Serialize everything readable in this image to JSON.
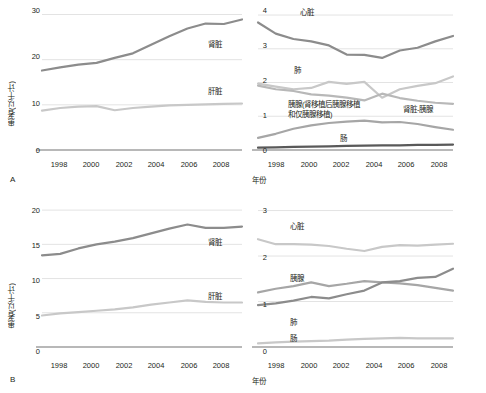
{
  "figure": {
    "background": "#ffffff",
    "colors": {
      "dark_gray": "#8c8c8c",
      "mid_gray": "#a6a6a6",
      "light_gray": "#c8c8c8",
      "very_light_gray": "#d6d6d6",
      "near_black": "#595959",
      "axis": "#a0a0a0",
      "grid": "#e3e3e3",
      "text": "#231f20"
    },
    "panel_letters": [
      "A",
      "B"
    ],
    "xaxis_title": "年份",
    "yaxis_title": "患者(以千计)"
  },
  "chart_data": [
    {
      "id": "panel-a-left",
      "type": "line",
      "title": "",
      "xlabel": "年份",
      "ylabel": "患者(以千计)",
      "panel_letter": "A",
      "x": [
        1998,
        1999,
        2000,
        2001,
        2002,
        2003,
        2004,
        2005,
        2006,
        2007,
        2008,
        2009
      ],
      "xticks": [
        1998,
        2000,
        2002,
        2004,
        2006,
        2008
      ],
      "yticks": [
        0,
        10,
        20,
        30
      ],
      "ylim": [
        0,
        31
      ],
      "grid": true,
      "legend_position": "inline-right",
      "series": [
        {
          "name": "肾脏",
          "color": "#8c8c8c",
          "values": [
            17.6,
            18.3,
            18.9,
            19.3,
            20.4,
            21.4,
            23.3,
            25.2,
            26.9,
            28.0,
            27.9,
            28.9
          ]
        },
        {
          "name": "肝脏",
          "color": "#c8c8c8",
          "values": [
            8.7,
            9.3,
            9.6,
            9.7,
            8.8,
            9.3,
            9.6,
            9.9,
            10.0,
            10.1,
            10.2,
            10.3
          ]
        }
      ]
    },
    {
      "id": "panel-a-right",
      "type": "line",
      "title": "",
      "xlabel": "年份",
      "ylabel": "",
      "panel_letter": "",
      "x": [
        1998,
        1999,
        2000,
        2001,
        2002,
        2003,
        2004,
        2005,
        2006,
        2007,
        2008,
        2009
      ],
      "xticks": [
        1998,
        2000,
        2002,
        2004,
        2006,
        2008
      ],
      "yticks": [
        0,
        1,
        2,
        3,
        4
      ],
      "ylim": [
        0,
        4.15
      ],
      "grid": true,
      "legend_position": "inline",
      "series": [
        {
          "name": "心脏",
          "color": "#8c8c8c",
          "values": [
            3.78,
            3.45,
            3.29,
            3.22,
            3.1,
            2.83,
            2.82,
            2.73,
            2.95,
            3.03,
            3.22,
            3.38
          ]
        },
        {
          "name": "肺",
          "color": "#c8c8c8",
          "values": [
            1.97,
            1.88,
            1.8,
            1.84,
            2.02,
            1.96,
            2.02,
            1.55,
            1.8,
            1.9,
            1.98,
            2.18
          ]
        },
        {
          "name": "肾脏-胰腺",
          "color": "#b8b8b8",
          "values": [
            1.91,
            1.8,
            1.75,
            1.65,
            1.61,
            1.55,
            1.47,
            1.67,
            1.54,
            1.46,
            1.4,
            1.37
          ]
        },
        {
          "name": "胰腺(肾移植后胰腺移植和仅胰腺移植)",
          "color": "#a6a6a6",
          "values": [
            0.36,
            0.48,
            0.63,
            0.73,
            0.8,
            0.84,
            0.87,
            0.82,
            0.83,
            0.77,
            0.68,
            0.6
          ]
        },
        {
          "name": "肠",
          "color": "#595959",
          "values": [
            0.07,
            0.08,
            0.09,
            0.1,
            0.11,
            0.12,
            0.13,
            0.14,
            0.14,
            0.15,
            0.15,
            0.16
          ]
        }
      ]
    },
    {
      "id": "panel-b-left",
      "type": "line",
      "title": "",
      "xlabel": "年份",
      "ylabel": "患者(以千计)",
      "panel_letter": "B",
      "x": [
        1998,
        1999,
        2000,
        2001,
        2002,
        2003,
        2004,
        2005,
        2006,
        2007,
        2008,
        2009
      ],
      "xticks": [
        1998,
        2000,
        2002,
        2004,
        2006,
        2008
      ],
      "yticks": [
        0,
        5,
        10,
        15,
        20
      ],
      "ylim": [
        0,
        20.6
      ],
      "grid": true,
      "legend_position": "inline-right",
      "series": [
        {
          "name": "肾脏",
          "color": "#8c8c8c",
          "values": [
            13.4,
            13.6,
            14.4,
            15.0,
            15.4,
            15.9,
            16.6,
            17.3,
            17.9,
            17.4,
            17.4,
            17.6
          ]
        },
        {
          "name": "肝脏",
          "color": "#c8c8c8",
          "values": [
            4.6,
            4.9,
            5.1,
            5.3,
            5.5,
            5.8,
            6.2,
            6.5,
            6.8,
            6.6,
            6.5,
            6.5
          ]
        }
      ]
    },
    {
      "id": "panel-b-right",
      "type": "line",
      "title": "",
      "xlabel": "年份",
      "ylabel": "",
      "panel_letter": "",
      "x": [
        1998,
        1999,
        2000,
        2001,
        2002,
        2003,
        2004,
        2005,
        2006,
        2007,
        2008,
        2009
      ],
      "xticks": [
        1998,
        2000,
        2002,
        2004,
        2006,
        2008
      ],
      "yticks": [
        0,
        1,
        2,
        3
      ],
      "ylim": [
        0,
        3.1
      ],
      "grid": true,
      "legend_position": "inline",
      "series": [
        {
          "name": "心脏",
          "color": "#c8c8c8",
          "values": [
            2.37,
            2.26,
            2.26,
            2.25,
            2.22,
            2.16,
            2.11,
            2.2,
            2.24,
            2.23,
            2.25,
            2.27
          ]
        },
        {
          "name": "胰腺",
          "color": "#a6a6a6",
          "values": [
            1.2,
            1.28,
            1.34,
            1.42,
            1.34,
            1.39,
            1.45,
            1.42,
            1.4,
            1.36,
            1.3,
            1.24
          ]
        },
        {
          "name": "肺",
          "color": "#8c8c8c",
          "values": [
            0.92,
            0.96,
            1.02,
            1.1,
            1.07,
            1.16,
            1.24,
            1.42,
            1.45,
            1.52,
            1.54,
            1.72
          ]
        },
        {
          "name": "肠",
          "color": "#c8c8c8",
          "values": [
            0.08,
            0.1,
            0.12,
            0.13,
            0.14,
            0.16,
            0.18,
            0.19,
            0.2,
            0.19,
            0.19,
            0.19
          ]
        }
      ]
    }
  ],
  "labels": {
    "panel_a_left": {
      "ticks_y": [
        "30",
        "20",
        "10",
        "0"
      ],
      "ticks_x": [
        "1998",
        "2000",
        "2002",
        "2004",
        "2006",
        "2008"
      ],
      "series_kidney": "肾脏",
      "series_liver": "肝脏",
      "ylabel": "患者(以千计)",
      "letter": "A"
    },
    "panel_a_right": {
      "ticks_y": [
        "4",
        "3",
        "2",
        "1",
        "0"
      ],
      "ticks_x": [
        "1998",
        "2000",
        "2002",
        "2004",
        "2006",
        "2008"
      ],
      "series_heart": "心脏",
      "series_lung": "肺",
      "series_pancreas": "胰腺(肾移植后胰腺移植和仅胰腺移植)",
      "series_kidney_pancreas": "肾脏-胰腺",
      "series_intestine": "肠",
      "xlabel": "年份"
    },
    "panel_b_left": {
      "ticks_y": [
        "20",
        "15",
        "10",
        "5",
        "0"
      ],
      "ticks_x": [
        "1998",
        "2000",
        "2002",
        "2004",
        "2006",
        "2008"
      ],
      "series_kidney": "肾脏",
      "series_liver": "肝脏",
      "ylabel": "患者(以千计)",
      "letter": "B"
    },
    "panel_b_right": {
      "ticks_y": [
        "3",
        "2",
        "1",
        "0"
      ],
      "ticks_x": [
        "1998",
        "2000",
        "2002",
        "2004",
        "2006",
        "2008"
      ],
      "series_heart": "心脏",
      "series_pancreas": "胰腺",
      "series_lung": "肺",
      "series_intestine": "肠",
      "xlabel": "年份"
    }
  }
}
